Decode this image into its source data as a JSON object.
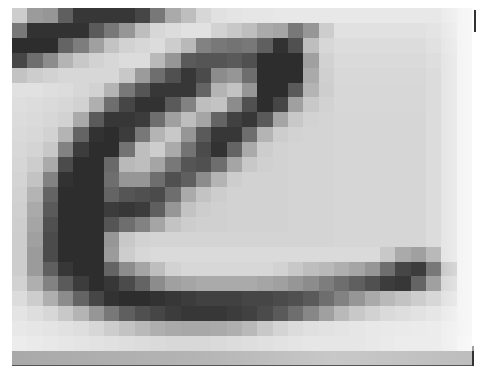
{
  "figure": {
    "grid": {
      "cols": 30,
      "rows": 23,
      "rows_data": [
        [
          205,
          155,
          150,
          95,
          55,
          55,
          55,
          55,
          70,
          120,
          170,
          190,
          215,
          225,
          228,
          230,
          230,
          232,
          232,
          232,
          232,
          232,
          232,
          232,
          232,
          232,
          232,
          232,
          235,
          240
        ],
        [
          120,
          50,
          50,
          50,
          50,
          90,
          120,
          150,
          190,
          215,
          220,
          225,
          225,
          210,
          200,
          190,
          170,
          165,
          120,
          150,
          205,
          225,
          225,
          225,
          225,
          225,
          225,
          228,
          232,
          240
        ],
        [
          45,
          45,
          45,
          100,
          125,
          160,
          195,
          210,
          215,
          220,
          205,
          185,
          130,
          120,
          115,
          120,
          95,
          50,
          80,
          190,
          215,
          220,
          220,
          220,
          220,
          220,
          220,
          225,
          230,
          240
        ],
        [
          70,
          110,
          140,
          180,
          200,
          210,
          215,
          220,
          220,
          185,
          150,
          90,
          85,
          85,
          90,
          80,
          45,
          45,
          45,
          160,
          210,
          218,
          218,
          218,
          218,
          218,
          218,
          222,
          228,
          240
        ],
        [
          195,
          205,
          210,
          215,
          215,
          215,
          215,
          200,
          155,
          110,
          80,
          55,
          75,
          140,
          150,
          110,
          45,
          45,
          45,
          170,
          208,
          216,
          216,
          216,
          216,
          216,
          216,
          220,
          228,
          240
        ],
        [
          225,
          225,
          222,
          220,
          215,
          210,
          180,
          120,
          85,
          55,
          55,
          55,
          100,
          180,
          195,
          150,
          45,
          45,
          90,
          180,
          206,
          215,
          215,
          215,
          215,
          215,
          215,
          220,
          228,
          240
        ],
        [
          222,
          220,
          218,
          215,
          210,
          175,
          110,
          70,
          50,
          50,
          90,
          130,
          190,
          195,
          140,
          80,
          45,
          70,
          160,
          200,
          210,
          215,
          215,
          215,
          215,
          215,
          215,
          220,
          228,
          240
        ],
        [
          220,
          218,
          215,
          210,
          170,
          90,
          55,
          55,
          60,
          110,
          160,
          190,
          165,
          100,
          65,
          55,
          90,
          165,
          200,
          210,
          212,
          214,
          214,
          214,
          214,
          214,
          214,
          220,
          228,
          240
        ],
        [
          218,
          216,
          210,
          180,
          100,
          50,
          45,
          60,
          120,
          180,
          200,
          150,
          90,
          55,
          55,
          110,
          180,
          205,
          210,
          212,
          212,
          214,
          214,
          214,
          214,
          214,
          214,
          220,
          228,
          240
        ],
        [
          216,
          212,
          200,
          130,
          60,
          45,
          45,
          115,
          190,
          205,
          170,
          115,
          75,
          50,
          100,
          170,
          205,
          210,
          212,
          212,
          212,
          214,
          214,
          214,
          214,
          214,
          214,
          220,
          228,
          240
        ],
        [
          214,
          205,
          170,
          75,
          45,
          45,
          105,
          185,
          190,
          165,
          120,
          85,
          80,
          110,
          165,
          200,
          208,
          210,
          212,
          212,
          212,
          214,
          214,
          214,
          214,
          214,
          214,
          220,
          228,
          240
        ],
        [
          212,
          195,
          130,
          50,
          45,
          45,
          110,
          150,
          150,
          110,
          80,
          95,
          140,
          180,
          205,
          210,
          210,
          210,
          212,
          212,
          212,
          214,
          214,
          214,
          214,
          214,
          214,
          220,
          228,
          240
        ],
        [
          210,
          180,
          100,
          45,
          45,
          45,
          100,
          85,
          80,
          75,
          110,
          170,
          195,
          205,
          210,
          210,
          210,
          210,
          212,
          212,
          212,
          214,
          214,
          214,
          214,
          214,
          214,
          220,
          228,
          240
        ],
        [
          208,
          170,
          90,
          45,
          45,
          45,
          60,
          55,
          60,
          95,
          150,
          195,
          205,
          208,
          210,
          210,
          210,
          210,
          212,
          212,
          212,
          214,
          214,
          214,
          214,
          214,
          214,
          220,
          228,
          240
        ],
        [
          206,
          165,
          80,
          45,
          45,
          45,
          85,
          110,
          130,
          165,
          195,
          205,
          208,
          208,
          210,
          210,
          210,
          210,
          212,
          212,
          212,
          214,
          214,
          214,
          214,
          214,
          214,
          220,
          228,
          240
        ],
        [
          205,
          160,
          75,
          45,
          45,
          45,
          150,
          200,
          210,
          212,
          212,
          212,
          212,
          212,
          212,
          212,
          212,
          212,
          212,
          212,
          212,
          214,
          214,
          214,
          214,
          214,
          214,
          220,
          228,
          240
        ],
        [
          205,
          155,
          75,
          45,
          45,
          45,
          155,
          205,
          215,
          218,
          218,
          218,
          218,
          218,
          218,
          218,
          218,
          218,
          218,
          218,
          218,
          218,
          218,
          218,
          200,
          170,
          160,
          185,
          228,
          240
        ],
        [
          205,
          155,
          95,
          55,
          45,
          45,
          100,
          140,
          165,
          190,
          210,
          215,
          215,
          215,
          215,
          215,
          215,
          210,
          200,
          190,
          185,
          175,
          165,
          150,
          110,
          70,
          60,
          120,
          200,
          240
        ],
        [
          210,
          175,
          130,
          90,
          60,
          45,
          55,
          75,
          100,
          140,
          160,
          165,
          170,
          170,
          170,
          170,
          165,
          160,
          150,
          140,
          125,
          110,
          95,
          80,
          60,
          55,
          100,
          160,
          215,
          240
        ],
        [
          220,
          205,
          175,
          140,
          100,
          70,
          50,
          45,
          45,
          50,
          55,
          60,
          65,
          65,
          65,
          70,
          70,
          75,
          80,
          90,
          110,
          130,
          150,
          170,
          185,
          195,
          205,
          215,
          225,
          240
        ],
        [
          228,
          222,
          215,
          200,
          180,
          150,
          120,
          95,
          80,
          70,
          60,
          55,
          55,
          55,
          60,
          65,
          75,
          90,
          110,
          135,
          160,
          185,
          200,
          210,
          218,
          222,
          226,
          230,
          234,
          240
        ],
        [
          232,
          230,
          228,
          225,
          222,
          215,
          205,
          195,
          185,
          175,
          170,
          168,
          168,
          170,
          175,
          185,
          200,
          212,
          220,
          224,
          226,
          228,
          230,
          232,
          233,
          234,
          235,
          236,
          238,
          240
        ],
        [
          236,
          234,
          232,
          230,
          228,
          226,
          224,
          222,
          220,
          218,
          216,
          216,
          216,
          218,
          220,
          222,
          224,
          226,
          228,
          230,
          230,
          230,
          230,
          232,
          234,
          236,
          236,
          236,
          238,
          242
        ]
      ]
    }
  }
}
